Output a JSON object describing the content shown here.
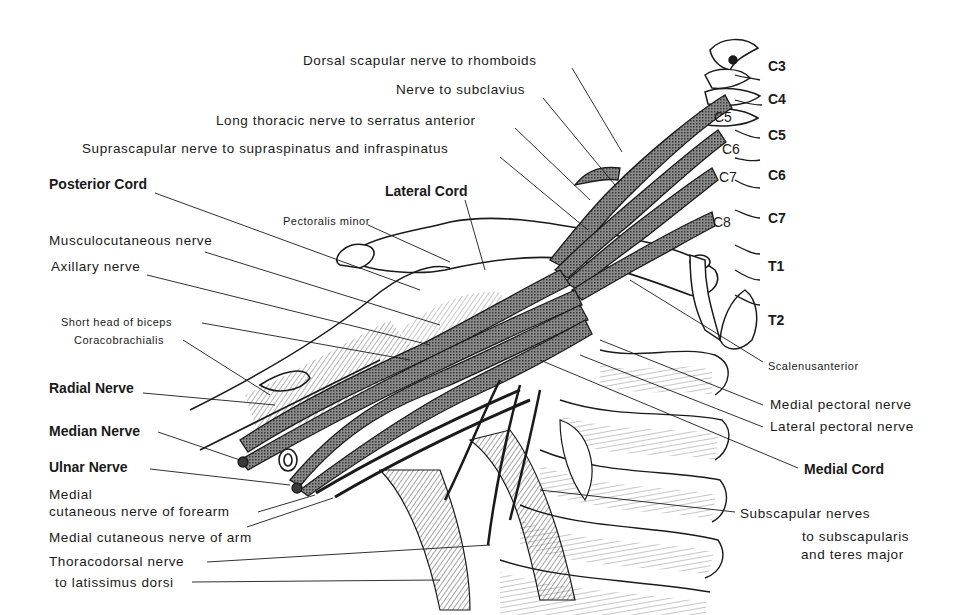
{
  "figure": {
    "stroke_color": "#1a1a1a",
    "nerve_fill": "#6e6e6e",
    "background": "#ffffff"
  },
  "labels": {
    "dorsal_scapular": "Dorsal scapular nerve to rhomboids",
    "nerve_subclavius": "Nerve to subclavius",
    "long_thoracic": "Long thoracic nerve to serratus anterior",
    "suprascapular": "Suprascapular nerve to supraspinatus and infraspinatus",
    "posterior_cord": "Posterior Cord",
    "lateral_cord": "Lateral Cord",
    "pectoralis_minor": "Pectoralis minor",
    "musculocutaneous": "Musculocutaneous  nerve",
    "axillary": "Axillary nerve",
    "short_head_biceps": "Short head of biceps",
    "coracobrachialis": "Coracobrachialis",
    "radial_nerve": "Radial Nerve",
    "median_nerve": "Median Nerve",
    "ulnar_nerve": "Ulnar Nerve",
    "medial_cut_forearm_1": "Medial",
    "medial_cut_forearm_2": "cutaneous nerve of forearm",
    "medial_cut_arm": "Medial cutaneous nerve of arm",
    "thoracodorsal_1": "Thoracodorsal nerve",
    "thoracodorsal_2": "to latissimus dorsi",
    "scalenus_anterior": "Scalenusanterior",
    "medial_pectoral": "Medial pectoral nerve",
    "lateral_pectoral": "Lateral pectoral nerve",
    "medial_cord": "Medial Cord",
    "subscapular_1": "Subscapular nerves",
    "subscapular_2": "to subscapularis",
    "subscapular_3": "and teres major"
  },
  "vertebrae": [
    "C3",
    "C4",
    "C5",
    "C6",
    "C7",
    "T1",
    "T2"
  ],
  "roots": [
    "C5",
    "C6",
    "C7",
    "C8"
  ]
}
